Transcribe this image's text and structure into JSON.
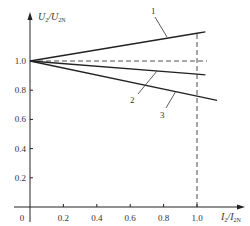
{
  "chart_data": {
    "type": "line",
    "title": "",
    "xlabel": "I2/I2N",
    "ylabel": "U2/U2N",
    "xlabel_parts": {
      "main": "I",
      "sub1": "2",
      "slash": "/",
      "main2": "I",
      "sub2": "2N"
    },
    "ylabel_parts": {
      "main": "U",
      "sub1": "2",
      "slash": "/",
      "main2": "U",
      "sub2": "2N"
    },
    "xlim": [
      0,
      1.2
    ],
    "ylim": [
      0,
      1.3
    ],
    "x_ticks": [
      0,
      0.2,
      0.4,
      0.6,
      0.8,
      1.0
    ],
    "x_tick_labels": [
      "0",
      "0.2",
      "0.4",
      "0.6",
      "0.8",
      "1.0"
    ],
    "y_ticks": [
      0.2,
      0.4,
      0.6,
      0.8,
      1.0
    ],
    "y_tick_labels": [
      "0.2",
      "0.4",
      "0.6",
      "0.8",
      "1.0"
    ],
    "grid": false,
    "legend": "none (curves numbered inline)",
    "series": [
      {
        "name": "1",
        "x": [
          0,
          1.0,
          1.05
        ],
        "values": [
          1.0,
          1.19,
          1.2
        ]
      },
      {
        "name": "2",
        "x": [
          0,
          1.0,
          1.05
        ],
        "values": [
          1.0,
          0.91,
          0.905
        ]
      },
      {
        "name": "3",
        "x": [
          0,
          1.0,
          1.12
        ],
        "values": [
          1.0,
          0.76,
          0.73
        ]
      }
    ],
    "reference_lines": [
      {
        "type": "horizontal",
        "y": 1.0,
        "style": "dashed",
        "x_end": 1.06
      },
      {
        "type": "vertical",
        "x": 1.0,
        "style": "dashed",
        "y_end": 1.2
      }
    ],
    "annotations": [
      {
        "text": "1",
        "target_series": "1"
      },
      {
        "text": "2",
        "target_series": "2"
      },
      {
        "text": "3",
        "target_series": "3"
      }
    ]
  },
  "colors": {
    "line": "#222222",
    "text": "#333333",
    "background": "#ffffff"
  }
}
